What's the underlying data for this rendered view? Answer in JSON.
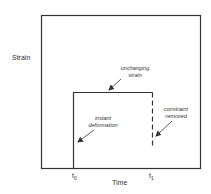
{
  "diagram": {
    "axes": {
      "y_label": "Strain",
      "x_label": "Time"
    },
    "ticks": {
      "t0": {
        "base": "t",
        "sub": "0"
      },
      "t1": {
        "base": "t",
        "sub": "1"
      }
    },
    "annotations": {
      "unchanging_strain": {
        "line1": "unchanging",
        "line2": "strain"
      },
      "constraint_removed": {
        "line1": "constraint",
        "line2": "removed"
      },
      "instant_deformation": {
        "line1": "instant",
        "line2": "deformation"
      }
    },
    "colors": {
      "line": "#333333",
      "background": "#ffffff"
    }
  }
}
